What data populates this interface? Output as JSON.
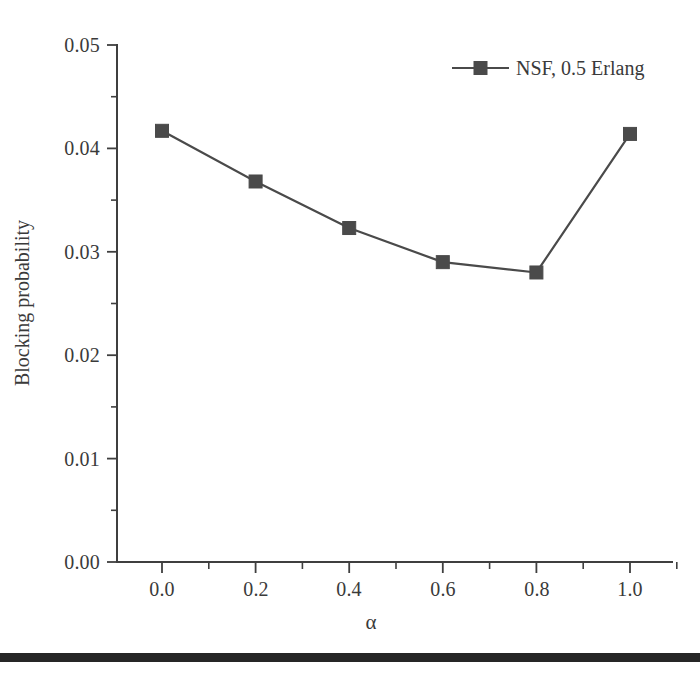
{
  "chart_data": {
    "type": "line",
    "title": "",
    "subtitle": "",
    "xlabel": "α",
    "ylabel": "Blocking probability",
    "xlim": [
      -0.06,
      1.12
    ],
    "ylim": [
      0.0,
      0.05
    ],
    "grid": false,
    "legend_position": "top-right",
    "x": [
      0.0,
      0.2,
      0.4,
      0.6,
      0.8,
      1.0
    ],
    "series": [
      {
        "name": "NSF, 0.5 Erlang",
        "marker": "square",
        "color": "#4a4a4a",
        "values": [
          0.0417,
          0.0368,
          0.0323,
          0.029,
          0.028,
          0.0414
        ]
      }
    ],
    "x_ticks": [
      {
        "value": 0.0,
        "label": "0.0"
      },
      {
        "value": 0.2,
        "label": "0.2"
      },
      {
        "value": 0.4,
        "label": "0.4"
      },
      {
        "value": 0.6,
        "label": "0.6"
      },
      {
        "value": 0.8,
        "label": "0.8"
      },
      {
        "value": 1.0,
        "label": "1.0"
      }
    ],
    "x_minor_ticks": [
      0.1,
      0.3,
      0.5,
      0.7,
      0.9,
      1.1
    ],
    "y_ticks": [
      {
        "value": 0.05,
        "label": "0.05"
      },
      {
        "value": 0.04,
        "label": "0.04"
      },
      {
        "value": 0.03,
        "label": "0.03"
      },
      {
        "value": 0.02,
        "label": "0.02"
      },
      {
        "value": 0.01,
        "label": "0.01"
      },
      {
        "value": 0.0,
        "label": "0.00"
      }
    ],
    "y_minor_ticks": [
      0.045,
      0.035,
      0.025,
      0.015,
      0.005
    ],
    "legend": [
      {
        "label": "NSF, 0.5 Erlang",
        "color": "#4a4a4a",
        "marker": "square"
      }
    ],
    "annotations": []
  },
  "axis": {
    "y_title": "Blocking probability",
    "x_title": "α",
    "y_tick_labels": [
      "0.05",
      "0.04",
      "0.03",
      "0.02",
      "0.01",
      "0.00"
    ],
    "x_tick_labels": [
      "0.0",
      "0.2",
      "0.4",
      "0.6",
      "0.8",
      "1.0"
    ]
  },
  "legend": {
    "entry_label": "NSF, 0.5 Erlang"
  },
  "colors": {
    "series": "#4a4a4a",
    "axis": "#3f3f3f",
    "text": "#3a3a3a",
    "rule": "#262626",
    "background": "#ffffff"
  }
}
